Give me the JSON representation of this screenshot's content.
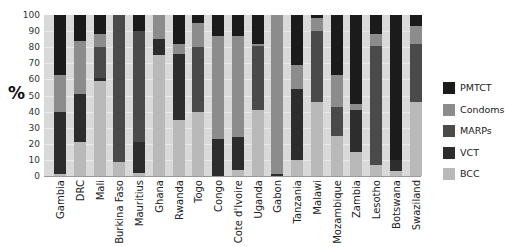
{
  "chart_data": {
    "type": "bar",
    "stacked": true,
    "title": "",
    "xlabel": "",
    "ylabel": "%",
    "ylim": [
      0,
      100
    ],
    "yticks": [
      0,
      10,
      20,
      30,
      40,
      50,
      60,
      70,
      80,
      90,
      100
    ],
    "grid": true,
    "legend_position": "right",
    "categories": [
      "Gambia",
      "DRC",
      "Mali",
      "Burkina Faso",
      "Mauritius",
      "Ghana",
      "Rwanda",
      "Togo",
      "Congo",
      "Cote d'Ivoire",
      "Uganda",
      "Gabon",
      "Tanzania",
      "Malawi",
      "Mozambique",
      "Zambia",
      "Lesotho",
      "Botswana",
      "Swaziland"
    ],
    "series": [
      {
        "name": "BCC",
        "color": "#b9b9b9",
        "values": [
          1,
          21,
          59,
          9,
          2,
          75,
          35,
          40,
          0,
          4,
          41,
          0,
          10,
          46,
          25,
          15,
          7,
          3,
          46
        ]
      },
      {
        "name": "VCT",
        "color": "#2d2d2d",
        "values": [
          39,
          30,
          2,
          0,
          19,
          10,
          41,
          0,
          23,
          20,
          0,
          1,
          44,
          0,
          0,
          26,
          0,
          7,
          0
        ]
      },
      {
        "name": "MARPs",
        "color": "#4a4a4a",
        "values": [
          0,
          0,
          19,
          91,
          69,
          0,
          0,
          40,
          0,
          0,
          40,
          0,
          0,
          44,
          18,
          0,
          74,
          0,
          36
        ]
      },
      {
        "name": "Condoms",
        "color": "#8c8c8c",
        "values": [
          23,
          33,
          8,
          0,
          0,
          15,
          6,
          15,
          64,
          63,
          1,
          99,
          15,
          8,
          20,
          4,
          7,
          0,
          11
        ]
      },
      {
        "name": "PMTCT",
        "color": "#1b1b1b",
        "values": [
          37,
          16,
          12,
          0,
          10,
          0,
          18,
          5,
          13,
          13,
          18,
          0,
          31,
          2,
          37,
          55,
          12,
          90,
          7
        ]
      }
    ]
  },
  "legend": {
    "items": [
      {
        "label": "PMTCT",
        "color": "#1b1b1b"
      },
      {
        "label": "Condoms",
        "color": "#8c8c8c"
      },
      {
        "label": "MARPs",
        "color": "#4a4a4a"
      },
      {
        "label": "VCT",
        "color": "#2d2d2d"
      },
      {
        "label": "BCC",
        "color": "#b9b9b9"
      }
    ]
  }
}
